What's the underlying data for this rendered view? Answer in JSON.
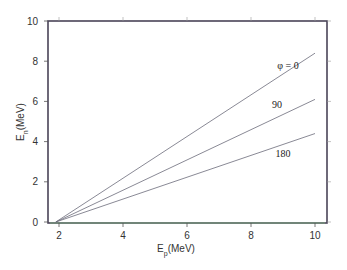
{
  "chart_data": {
    "type": "line",
    "title": "",
    "xlabel": "E_p(MeV)",
    "ylabel": "E_n(MeV)",
    "xlim": [
      1.6,
      10.5
    ],
    "ylim": [
      0,
      10
    ],
    "x_ticks": [
      "2",
      "4",
      "6",
      "8",
      "10"
    ],
    "y_ticks": [
      "0",
      "2",
      "4",
      "6",
      "8",
      "10"
    ],
    "grid": false,
    "legend": "inline labels near line ends",
    "series": [
      {
        "name": "φ = 0",
        "label": "φ = 0",
        "x": [
          1.9,
          10
        ],
        "y": [
          0,
          8.4
        ]
      },
      {
        "name": "90",
        "label": "90",
        "x": [
          1.9,
          10
        ],
        "y": [
          0,
          6.1
        ]
      },
      {
        "name": "180",
        "label": "180",
        "x": [
          1.9,
          10
        ],
        "y": [
          0,
          4.4
        ]
      }
    ],
    "colors": {
      "lines": "#6b6b7a",
      "frame": "#4a4458",
      "baseline_accent": "#7ccf7c"
    }
  }
}
